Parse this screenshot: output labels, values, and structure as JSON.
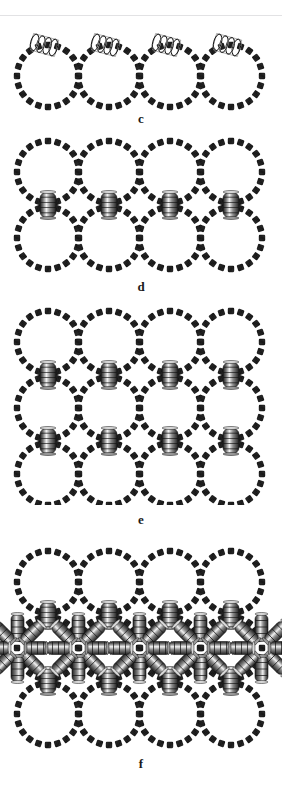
{
  "figure": {
    "name": "supramolecular-assembly-figure",
    "background_color": "#ffffff",
    "rule_color": "#e2e2e4",
    "block_color": "#1c1c1c",
    "coil_light": "#f2f2f2",
    "coil_mid": "#9a9a9a",
    "coil_dark": "#1e1e1e",
    "panels": [
      {
        "id": "c",
        "label": "c",
        "y": 18,
        "height": 112,
        "label_y": 112,
        "ring_rows": 1,
        "ring_cols": 4,
        "ring_radius": 31,
        "block_count": 20,
        "coil_orientation": "diagonal-top",
        "coil_count": 4,
        "coil_positions": [
          "top-of-each-ring"
        ]
      },
      {
        "id": "d",
        "label": "d",
        "y": 135,
        "height": 150,
        "label_y": 285,
        "ring_rows": 2,
        "ring_cols": 4,
        "ring_radius": 31,
        "block_count": 20,
        "coil_orientation": "vertical",
        "coil_count": 4,
        "coil_positions": [
          "between-row-1-and-row-2"
        ]
      },
      {
        "id": "e",
        "label": "e",
        "y": 305,
        "height": 215,
        "label_y": 520,
        "ring_rows": 3,
        "ring_cols": 4,
        "ring_radius": 31,
        "block_count": 20,
        "coil_orientation": "vertical",
        "coil_count": 8,
        "coil_positions": [
          "between-row-1-and-row-2",
          "between-row-2-and-row-3"
        ]
      },
      {
        "id": "f",
        "label": "f",
        "y": 545,
        "height": 215,
        "label_y": 762,
        "ring_rows": 3,
        "ring_cols": 4,
        "ring_radius": 31,
        "block_count": 20,
        "coil_orientation": "vertical-plus-radial",
        "coil_count": 8,
        "radial_coil_angles": [
          0,
          45,
          90,
          135,
          180,
          225,
          270,
          315
        ],
        "coil_positions": [
          "between-row-1-and-row-2",
          "between-row-2-and-row-3",
          "radiating-at-middle-row-junctions"
        ]
      }
    ]
  }
}
